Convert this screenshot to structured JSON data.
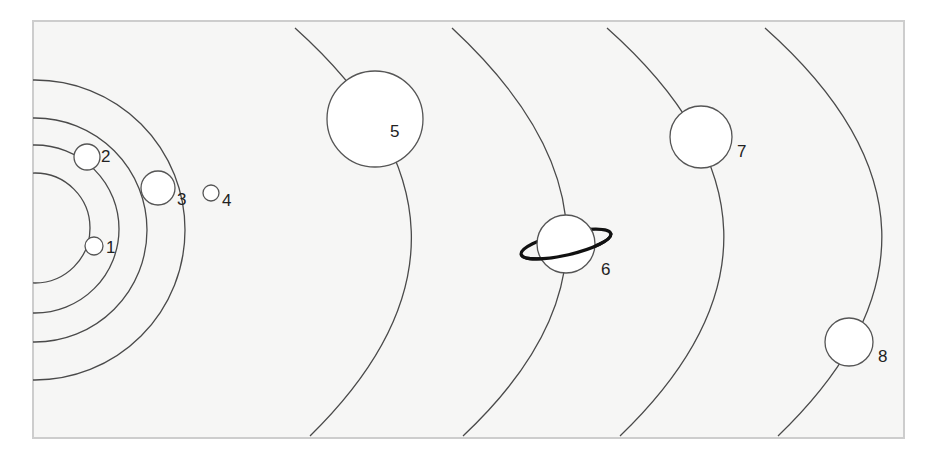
{
  "diagram": {
    "type": "solar-system-orbits",
    "colors": {
      "background": "#f6f6f5",
      "frame_border": "#cdcdcd",
      "orbit_line": "#4a4a4a",
      "planet_fill": "#ffffff",
      "ring": "#111111"
    },
    "frame": {
      "x": 33,
      "y": 21,
      "width": 871,
      "height": 417
    },
    "inner_orbits": [
      {
        "id": 1,
        "cx": 35,
        "cy": 228,
        "r": 55
      },
      {
        "id": 2,
        "cx": 35,
        "cy": 229,
        "r": 84
      },
      {
        "id": 3,
        "cx": 35,
        "cy": 230,
        "r": 112
      },
      {
        "id": 4,
        "cx": 35,
        "cy": 230,
        "r": 150
      }
    ],
    "outer_orbits": [
      {
        "id": 5,
        "d": "M 295 28 Q 520 230 310 436"
      },
      {
        "id": 6,
        "d": "M 452 28 Q 676 236 463 436"
      },
      {
        "id": 7,
        "d": "M 607 28 Q 834 230 620 436"
      },
      {
        "id": 8,
        "d": "M 765 28 Q 992 230 778 436"
      }
    ],
    "planets": [
      {
        "number": "1",
        "cx": 94,
        "cy": 246,
        "r": 9,
        "label_x": 106,
        "label_y": 253
      },
      {
        "number": "2",
        "cx": 87,
        "cy": 157,
        "r": 13,
        "label_x": 101,
        "label_y": 162
      },
      {
        "number": "3",
        "cx": 158,
        "cy": 188,
        "r": 17,
        "label_x": 177,
        "label_y": 205
      },
      {
        "number": "4",
        "cx": 211,
        "cy": 193,
        "r": 8,
        "label_x": 222,
        "label_y": 206
      },
      {
        "number": "5",
        "cx": 375,
        "cy": 119,
        "r": 48,
        "label_x": 390,
        "label_y": 137
      },
      {
        "number": "6",
        "cx": 566,
        "cy": 244,
        "r": 29,
        "label_x": 601,
        "label_y": 275,
        "ring": {
          "rx": 46,
          "ry": 11,
          "rotate": -13
        }
      },
      {
        "number": "7",
        "cx": 701,
        "cy": 137,
        "r": 31,
        "label_x": 737,
        "label_y": 157
      },
      {
        "number": "8",
        "cx": 849,
        "cy": 342,
        "r": 24,
        "label_x": 878,
        "label_y": 362
      }
    ]
  }
}
